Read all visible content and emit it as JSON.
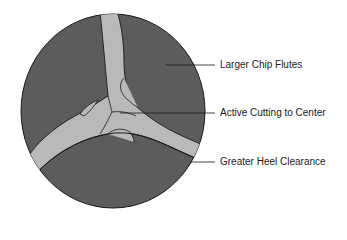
{
  "diagram": {
    "colors": {
      "body_fill": "#5c5c5c",
      "web_fill": "#b9b9b9",
      "outline": "#1a1a1a",
      "background": "#ffffff"
    },
    "labels": [
      {
        "id": "larger-chip-flutes",
        "text": "Larger Chip Flutes",
        "y": 65
      },
      {
        "id": "active-cutting-to-center",
        "text": "Active Cutting to Center",
        "y": 113
      },
      {
        "id": "greater-heel-clearance",
        "text": "Greater Heel Clearance",
        "y": 162
      }
    ]
  }
}
